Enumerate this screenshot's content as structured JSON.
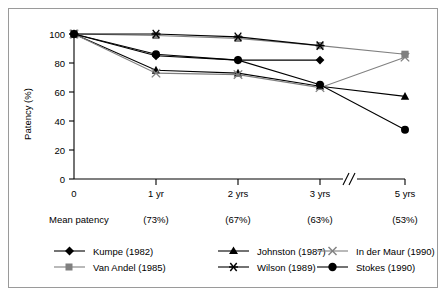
{
  "chart_data": {
    "type": "line",
    "title": "",
    "xlabel": "",
    "ylabel": "Patency (%)",
    "categories": [
      "0",
      "1 yr",
      "2 yrs",
      "3 yrs",
      "5 yrs"
    ],
    "ylim": [
      0,
      100
    ],
    "yticks": [
      0,
      20,
      40,
      60,
      80,
      100
    ],
    "grid": false,
    "axis_break_between": [
      "3 yrs",
      "5 yrs"
    ],
    "legend_position": "below-axis",
    "series": [
      {
        "name": "Kumpe (1982)",
        "marker": "filled-diamond",
        "color": "#000000",
        "x": [
          "0",
          "1 yr",
          "2 yrs",
          "3 yrs"
        ],
        "values": [
          100,
          85,
          82,
          82
        ]
      },
      {
        "name": "Van Andel (1985)",
        "marker": "filled-square",
        "color": "#808080",
        "x": [
          "0",
          "1 yr",
          "2 yrs",
          "3 yrs",
          "5 yrs"
        ],
        "values": [
          100,
          99,
          97,
          92,
          86
        ]
      },
      {
        "name": "Johnston (1987)",
        "marker": "filled-triangle",
        "color": "#000000",
        "x": [
          "0",
          "1 yr",
          "2 yrs",
          "3 yrs",
          "5 yrs"
        ],
        "values": [
          100,
          75,
          73,
          64,
          57
        ]
      },
      {
        "name": "Wilson (1989)",
        "marker": "asterisk",
        "color": "#000000",
        "x": [
          "0",
          "1 yr",
          "2 yrs",
          "3 yrs"
        ],
        "values": [
          100,
          100,
          98,
          92
        ]
      },
      {
        "name": "In der Maur (1990)",
        "marker": "x-cross",
        "color": "#808080",
        "x": [
          "0",
          "1 yr",
          "2 yrs",
          "3 yrs",
          "5 yrs"
        ],
        "values": [
          100,
          73,
          72,
          63,
          84
        ]
      },
      {
        "name": "Stokes (1990)",
        "marker": "filled-circle",
        "color": "#000000",
        "x": [
          "0",
          "1 yr",
          "2 yrs",
          "3 yrs",
          "5 yrs"
        ],
        "values": [
          100,
          86,
          82,
          65,
          34
        ]
      }
    ],
    "mean_patency": {
      "label": "Mean patency",
      "values": [
        "(73%)",
        "(67%)",
        "(63%)",
        "(53%)"
      ],
      "at": [
        "1 yr",
        "2 yrs",
        "3 yrs",
        "5 yrs"
      ]
    }
  },
  "axis": {
    "y_ticks": [
      "100",
      "80",
      "60",
      "40",
      "20",
      "0"
    ],
    "y_title": "Patency (%)",
    "x_ticks": [
      "0",
      "1 yr",
      "2 yrs",
      "3 yrs",
      "5 yrs"
    ]
  },
  "mean_row": {
    "label": "Mean patency",
    "v1": "(73%)",
    "v2": "(67%)",
    "v3": "(63%)",
    "v4": "(53%)"
  },
  "legend": {
    "items": [
      {
        "label": "Kumpe (1982)"
      },
      {
        "label": "Johnston (1987)"
      },
      {
        "label": "In der Maur (1990)"
      },
      {
        "label": "Van Andel (1985)"
      },
      {
        "label": "Wilson (1989)"
      },
      {
        "label": "Stokes (1990)"
      }
    ]
  },
  "colors": {
    "black": "#000000",
    "gray": "#808080",
    "frame": "#9a9a9a"
  }
}
